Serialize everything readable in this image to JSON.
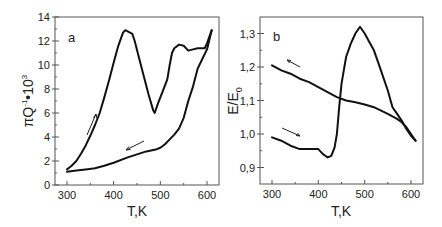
{
  "chart_data": [
    {
      "panel": "a",
      "type": "line",
      "title": "",
      "xlabel": "T,K",
      "ylabel": "πQ⁻¹·10³",
      "xlim": [
        280,
        620
      ],
      "ylim": [
        0,
        14
      ],
      "xticks": [
        300,
        400,
        500,
        600
      ],
      "yticks": [
        0,
        2,
        4,
        6,
        8,
        10,
        12,
        14
      ],
      "grid": false,
      "legend": null,
      "series": [
        {
          "name": "heating",
          "direction": "up-right arrow",
          "x": [
            300,
            310,
            320,
            330,
            340,
            350,
            360,
            370,
            380,
            390,
            400,
            410,
            420,
            425,
            430,
            440,
            445,
            455,
            465,
            475,
            485,
            488,
            495,
            505,
            515,
            520,
            525,
            530,
            540,
            550,
            560,
            570,
            580,
            595,
            600,
            610
          ],
          "y": [
            1.3,
            1.6,
            2.0,
            2.6,
            3.3,
            4.1,
            5.0,
            6.0,
            7.3,
            8.7,
            10.2,
            11.6,
            12.7,
            12.9,
            12.8,
            12.6,
            12.0,
            10.5,
            9.0,
            7.5,
            6.2,
            6.0,
            6.8,
            7.8,
            8.8,
            10.0,
            11.0,
            11.4,
            11.7,
            11.6,
            11.2,
            11.3,
            11.4,
            11.4,
            11.8,
            12.9
          ]
        },
        {
          "name": "cooling",
          "direction": "left arrow",
          "x": [
            610,
            600,
            590,
            580,
            570,
            560,
            550,
            540,
            530,
            520,
            510,
            500,
            490,
            470,
            450,
            430,
            400,
            380,
            360,
            340,
            320,
            300
          ],
          "y": [
            12.9,
            11.3,
            10.5,
            9.7,
            8.2,
            7.0,
            5.6,
            4.7,
            4.2,
            3.8,
            3.4,
            3.1,
            2.95,
            2.8,
            2.55,
            2.3,
            1.85,
            1.6,
            1.4,
            1.3,
            1.2,
            1.1
          ]
        }
      ],
      "annotations": [
        "a",
        "up arrow near heating branch",
        "left arrow near cooling branch"
      ]
    },
    {
      "panel": "b",
      "type": "line",
      "title": "",
      "xlabel": "T,K",
      "ylabel": "E/E₀",
      "xlim": [
        280,
        620
      ],
      "ylim": [
        0.85,
        1.35
      ],
      "xticks": [
        300,
        400,
        500,
        600
      ],
      "yticks": [
        0.9,
        1.0,
        1.1,
        1.2,
        1.3
      ],
      "ytick_labels": [
        "0,9",
        "1,0",
        "1,1",
        "1,2",
        "1,3"
      ],
      "grid": false,
      "legend": null,
      "series": [
        {
          "name": "heating",
          "direction": "right arrow",
          "x": [
            300,
            320,
            340,
            360,
            380,
            400,
            410,
            415,
            420,
            428,
            435,
            440,
            445,
            450,
            455,
            460,
            470,
            480,
            490,
            500,
            510,
            520,
            530,
            540,
            550,
            560,
            570,
            580,
            590,
            600,
            610
          ],
          "y": [
            0.99,
            0.98,
            0.965,
            0.955,
            0.955,
            0.955,
            0.94,
            0.935,
            0.93,
            0.935,
            0.96,
            1.0,
            1.08,
            1.15,
            1.19,
            1.23,
            1.27,
            1.3,
            1.32,
            1.3,
            1.275,
            1.25,
            1.21,
            1.17,
            1.13,
            1.08,
            1.06,
            1.04,
            1.015,
            0.995,
            0.98
          ]
        },
        {
          "name": "cooling",
          "direction": "left arrow",
          "x": [
            610,
            600,
            590,
            580,
            570,
            550,
            520,
            500,
            480,
            460,
            440,
            420,
            400,
            380,
            360,
            340,
            320,
            300
          ],
          "y": [
            0.98,
            1.0,
            1.02,
            1.035,
            1.045,
            1.06,
            1.08,
            1.088,
            1.095,
            1.1,
            1.11,
            1.125,
            1.14,
            1.155,
            1.165,
            1.18,
            1.19,
            1.205
          ]
        }
      ],
      "annotations": [
        "b",
        "left arrow near cooling branch",
        "right arrow near heating branch"
      ]
    }
  ],
  "panels": {
    "a": {
      "letter": "a",
      "xlabel": "T,K",
      "ylabel_main": "πQ",
      "ylabel_sup1": "-1",
      "ylabel_mid": "•10",
      "ylabel_sup2": "3",
      "xtick_labels": [
        "300",
        "400",
        "500",
        "600"
      ],
      "ytick_labels": [
        "0",
        "2",
        "4",
        "6",
        "8",
        "10",
        "12",
        "14"
      ]
    },
    "b": {
      "letter": "b",
      "xlabel": "T,K",
      "ylabel_main": "E/E",
      "ylabel_sub": "0",
      "xtick_labels": [
        "300",
        "400",
        "500",
        "600"
      ],
      "ytick_labels": [
        "0,9",
        "1,0",
        "1,1",
        "1,2",
        "1,3"
      ]
    }
  },
  "colors": {
    "line": "#111111",
    "frame": "#555555",
    "text": "#222222",
    "background": "#ffffff"
  }
}
